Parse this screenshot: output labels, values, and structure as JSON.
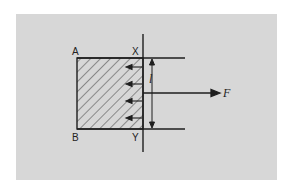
{
  "diagram": {
    "background_color": "#ffffff",
    "panel_color": "#d7d7d7",
    "ink_color": "#1e1e1e",
    "labels": {
      "corner_top_left": "A",
      "corner_bottom_left": "B",
      "corner_top_right": "X",
      "corner_bottom_right": "Y",
      "length": "l",
      "force": "F"
    },
    "elements": {
      "hatched_region": "rectangle ABYX with diagonal hatching",
      "dividing_line": "vertical line XY",
      "surface_arrows_count": 4,
      "surface_arrows_direction": "left",
      "length_dimension": "double-headed vertical arrow between top and bottom lines",
      "force_arrow_direction": "right"
    }
  }
}
